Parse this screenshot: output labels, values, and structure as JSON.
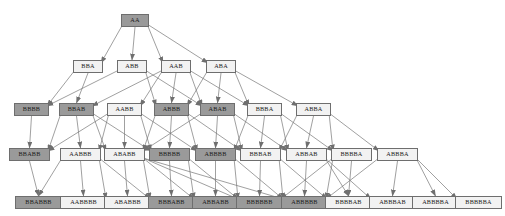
{
  "diagram": {
    "type": "directed-acyclic-graph",
    "colors": {
      "node_fill_light": "#f2f2f2",
      "node_fill_dark": "#9a9a9a",
      "node_border": "#6e6e6e",
      "edge": "#777777",
      "background": "#ffffff",
      "text": "#1a1a1a"
    },
    "levels": [
      {
        "index": 0,
        "y": 14
      },
      {
        "index": 1,
        "y": 60
      },
      {
        "index": 2,
        "y": 103
      },
      {
        "index": 3,
        "y": 148
      },
      {
        "index": 4,
        "y": 196
      }
    ],
    "nodes": [
      {
        "id": "AA",
        "label": "AA",
        "level": 0,
        "x": 121,
        "y": 14,
        "w": 28,
        "h": 13,
        "fill": "dark",
        "font": 6.2
      },
      {
        "id": "BBA",
        "label": "BBA",
        "level": 1,
        "x": 73,
        "y": 60,
        "w": 30,
        "h": 13,
        "fill": "light",
        "font": 6.2
      },
      {
        "id": "ABB",
        "label": "ABB",
        "level": 1,
        "x": 117,
        "y": 60,
        "w": 30,
        "h": 13,
        "fill": "light",
        "font": 6.2
      },
      {
        "id": "AAB",
        "label": "AAB",
        "level": 1,
        "x": 161,
        "y": 60,
        "w": 30,
        "h": 13,
        "fill": "light",
        "font": 6.2
      },
      {
        "id": "ABA",
        "label": "ABA",
        "level": 1,
        "x": 206,
        "y": 60,
        "w": 30,
        "h": 13,
        "fill": "light",
        "font": 6.2
      },
      {
        "id": "BBBB",
        "label": "BBBB",
        "level": 2,
        "x": 14,
        "y": 103,
        "w": 35,
        "h": 13,
        "fill": "dark",
        "font": 6.2
      },
      {
        "id": "BBAB",
        "label": "BBAB",
        "level": 2,
        "x": 59,
        "y": 103,
        "w": 35,
        "h": 13,
        "fill": "dark",
        "font": 6.2
      },
      {
        "id": "AABB",
        "label": "AABB",
        "level": 2,
        "x": 107,
        "y": 103,
        "w": 35,
        "h": 13,
        "fill": "light",
        "font": 6.2
      },
      {
        "id": "ABBB",
        "label": "ABBB",
        "level": 2,
        "x": 154,
        "y": 103,
        "w": 35,
        "h": 13,
        "fill": "dark",
        "font": 6.2
      },
      {
        "id": "ABAB",
        "label": "ABAB",
        "level": 2,
        "x": 200,
        "y": 103,
        "w": 35,
        "h": 13,
        "fill": "dark",
        "font": 6.2
      },
      {
        "id": "BBBA",
        "label": "BBBA",
        "level": 2,
        "x": 247,
        "y": 103,
        "w": 35,
        "h": 13,
        "fill": "light",
        "font": 6.2
      },
      {
        "id": "ABBA",
        "label": "ABBA",
        "level": 2,
        "x": 296,
        "y": 103,
        "w": 35,
        "h": 13,
        "fill": "light",
        "font": 6.2
      },
      {
        "id": "BBABB",
        "label": "BBABB",
        "level": 3,
        "x": 9,
        "y": 148,
        "w": 41,
        "h": 13,
        "fill": "dark",
        "font": 6.2
      },
      {
        "id": "AABBB",
        "label": "AABBB",
        "level": 3,
        "x": 60,
        "y": 148,
        "w": 41,
        "h": 13,
        "fill": "light",
        "font": 6.2
      },
      {
        "id": "ABABB",
        "label": "ABABB",
        "level": 3,
        "x": 104,
        "y": 148,
        "w": 41,
        "h": 13,
        "fill": "light",
        "font": 6.2
      },
      {
        "id": "BBBBB",
        "label": "BBBBB",
        "level": 3,
        "x": 149,
        "y": 148,
        "w": 41,
        "h": 13,
        "fill": "dark",
        "font": 6.2
      },
      {
        "id": "ABBBB",
        "label": "ABBBB",
        "level": 3,
        "x": 195,
        "y": 148,
        "w": 41,
        "h": 13,
        "fill": "dark",
        "font": 6.2
      },
      {
        "id": "BBBAB",
        "label": "BBBAB",
        "level": 3,
        "x": 240,
        "y": 148,
        "w": 41,
        "h": 13,
        "fill": "light",
        "font": 6.2
      },
      {
        "id": "ABBAB",
        "label": "ABBAB",
        "level": 3,
        "x": 286,
        "y": 148,
        "w": 41,
        "h": 13,
        "fill": "light",
        "font": 6.2
      },
      {
        "id": "BBBBA",
        "label": "BBBBA",
        "level": 3,
        "x": 331,
        "y": 148,
        "w": 41,
        "h": 13,
        "fill": "light",
        "font": 6.2
      },
      {
        "id": "ABBBA",
        "label": "ABBBA",
        "level": 3,
        "x": 377,
        "y": 148,
        "w": 41,
        "h": 13,
        "fill": "light",
        "font": 6.2
      },
      {
        "id": "BBABBB",
        "label": "BBABBB",
        "level": 4,
        "x": 15,
        "y": 196,
        "w": 47,
        "h": 13,
        "fill": "dark",
        "font": 6.2
      },
      {
        "id": "AABBBB",
        "label": "AABBBB",
        "level": 4,
        "x": 60,
        "y": 196,
        "w": 47,
        "h": 13,
        "fill": "light",
        "font": 6.2
      },
      {
        "id": "ABABBB",
        "label": "ABABBB",
        "level": 4,
        "x": 104,
        "y": 196,
        "w": 47,
        "h": 13,
        "fill": "light",
        "font": 6.2
      },
      {
        "id": "BBBABB",
        "label": "BBBABB",
        "level": 4,
        "x": 148,
        "y": 196,
        "w": 47,
        "h": 13,
        "fill": "dark",
        "font": 6.2
      },
      {
        "id": "ABBABB",
        "label": "ABBABB",
        "level": 4,
        "x": 192,
        "y": 196,
        "w": 47,
        "h": 13,
        "fill": "dark",
        "font": 6.2
      },
      {
        "id": "BBBBBB",
        "label": "BBBBBB",
        "level": 4,
        "x": 236,
        "y": 196,
        "w": 47,
        "h": 13,
        "fill": "dark",
        "font": 6.2
      },
      {
        "id": "ABBBBB",
        "label": "ABBBBB",
        "level": 4,
        "x": 281,
        "y": 196,
        "w": 47,
        "h": 13,
        "fill": "dark",
        "font": 6.2
      },
      {
        "id": "BBBBAB",
        "label": "BBBBAB",
        "level": 4,
        "x": 325,
        "y": 196,
        "w": 47,
        "h": 13,
        "fill": "light",
        "font": 6.2
      },
      {
        "id": "ABBBAB",
        "label": "ABBBAB",
        "level": 4,
        "x": 369,
        "y": 196,
        "w": 47,
        "h": 13,
        "fill": "light",
        "font": 6.2
      },
      {
        "id": "ABBBBA",
        "label": "ABBBBA",
        "level": 4,
        "x": 412,
        "y": 196,
        "w": 47,
        "h": 13,
        "fill": "light",
        "font": 6.2
      },
      {
        "id": "BBBBBA",
        "label": "BBBBBA",
        "level": 4,
        "x": 455,
        "y": 196,
        "w": 47,
        "h": 13,
        "fill": "light",
        "font": 6.2
      }
    ],
    "edges": [
      {
        "from": "AA",
        "to": "BBA"
      },
      {
        "from": "AA",
        "to": "ABB"
      },
      {
        "from": "AA",
        "to": "AAB"
      },
      {
        "from": "AA",
        "to": "ABA"
      },
      {
        "from": "BBA",
        "to": "BBBB"
      },
      {
        "from": "BBA",
        "to": "BBAB"
      },
      {
        "from": "ABB",
        "to": "BBBB"
      },
      {
        "from": "ABB",
        "to": "ABBB"
      },
      {
        "from": "ABB",
        "to": "ABAB"
      },
      {
        "from": "AAB",
        "to": "BBAB"
      },
      {
        "from": "AAB",
        "to": "AABB"
      },
      {
        "from": "AAB",
        "to": "ABBB"
      },
      {
        "from": "AAB",
        "to": "ABAB"
      },
      {
        "from": "AAB",
        "to": "BBBA"
      },
      {
        "from": "ABA",
        "to": "ABBB"
      },
      {
        "from": "ABA",
        "to": "ABAB"
      },
      {
        "from": "ABA",
        "to": "BBBA"
      },
      {
        "from": "ABA",
        "to": "ABBA"
      },
      {
        "from": "BBBB",
        "to": "BBABB"
      },
      {
        "from": "BBAB",
        "to": "BBABB"
      },
      {
        "from": "BBAB",
        "to": "AABBB"
      },
      {
        "from": "BBAB",
        "to": "ABABB"
      },
      {
        "from": "BBAB",
        "to": "BBBBB"
      },
      {
        "from": "AABB",
        "to": "BBABB"
      },
      {
        "from": "AABB",
        "to": "AABBB"
      },
      {
        "from": "AABB",
        "to": "ABABB"
      },
      {
        "from": "AABB",
        "to": "BBBBB"
      },
      {
        "from": "AABB",
        "to": "ABBBB"
      },
      {
        "from": "ABBB",
        "to": "ABABB"
      },
      {
        "from": "ABBB",
        "to": "BBBBB"
      },
      {
        "from": "ABBB",
        "to": "ABBBB"
      },
      {
        "from": "ABBB",
        "to": "BBBAB"
      },
      {
        "from": "ABAB",
        "to": "ABABB"
      },
      {
        "from": "ABAB",
        "to": "ABBBB"
      },
      {
        "from": "ABAB",
        "to": "BBBAB"
      },
      {
        "from": "ABAB",
        "to": "ABBAB"
      },
      {
        "from": "BBBA",
        "to": "ABBBB"
      },
      {
        "from": "BBBA",
        "to": "BBBAB"
      },
      {
        "from": "BBBA",
        "to": "ABBAB"
      },
      {
        "from": "BBBA",
        "to": "BBBBA"
      },
      {
        "from": "ABBA",
        "to": "BBBAB"
      },
      {
        "from": "ABBA",
        "to": "ABBAB"
      },
      {
        "from": "ABBA",
        "to": "BBBBA"
      },
      {
        "from": "ABBA",
        "to": "ABBBA"
      },
      {
        "from": "BBABB",
        "to": "BBABBB"
      },
      {
        "from": "AABBB",
        "to": "BBABBB"
      },
      {
        "from": "AABBB",
        "to": "AABBBB"
      },
      {
        "from": "AABBB",
        "to": "ABABBB"
      },
      {
        "from": "AABBB",
        "to": "BBBABB"
      },
      {
        "from": "ABABB",
        "to": "ABABBB"
      },
      {
        "from": "ABABB",
        "to": "BBBABB"
      },
      {
        "from": "ABABB",
        "to": "ABBABB"
      },
      {
        "from": "ABABB",
        "to": "BBBBBB"
      },
      {
        "from": "ABABB",
        "to": "ABBBBB"
      },
      {
        "from": "BBBBB",
        "to": "BBBABB"
      },
      {
        "from": "BBBBB",
        "to": "ABBABB"
      },
      {
        "from": "BBBBB",
        "to": "BBBBBB"
      },
      {
        "from": "ABBBB",
        "to": "ABBABB"
      },
      {
        "from": "ABBBB",
        "to": "BBBBBB"
      },
      {
        "from": "ABBBB",
        "to": "ABBBBB"
      },
      {
        "from": "BBBAB",
        "to": "BBBBBB"
      },
      {
        "from": "BBBAB",
        "to": "ABBBBB"
      },
      {
        "from": "BBBAB",
        "to": "BBBBAB"
      },
      {
        "from": "ABBAB",
        "to": "ABBBBB"
      },
      {
        "from": "ABBAB",
        "to": "BBBBAB"
      },
      {
        "from": "ABBAB",
        "to": "ABBBAB"
      },
      {
        "from": "BBBBA",
        "to": "BBBBBB"
      },
      {
        "from": "BBBBA",
        "to": "ABBBBB"
      },
      {
        "from": "BBBBA",
        "to": "BBBBAB"
      },
      {
        "from": "ABBBA",
        "to": "ABBBBB"
      },
      {
        "from": "ABBBA",
        "to": "ABBBAB"
      },
      {
        "from": "ABBBA",
        "to": "ABBBBA"
      },
      {
        "from": "ABBBA",
        "to": "BBBBBA"
      }
    ]
  }
}
